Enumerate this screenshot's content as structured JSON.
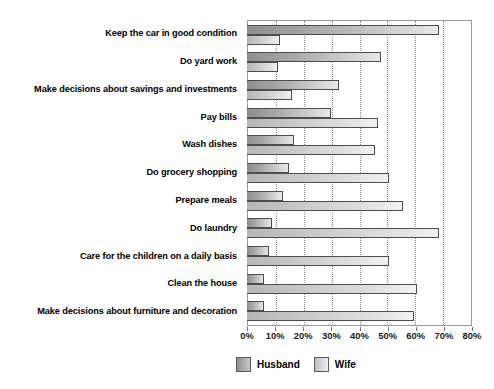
{
  "chart_data": {
    "type": "bar",
    "orientation": "horizontal",
    "title": "",
    "xlabel": "",
    "ylabel": "",
    "xlim": [
      0,
      80
    ],
    "xtick_labels": [
      "0%",
      "10%",
      "20%",
      "30%",
      "40%",
      "50%",
      "60%",
      "70%",
      "80%"
    ],
    "xtick_values": [
      0,
      10,
      20,
      30,
      40,
      50,
      60,
      70,
      80
    ],
    "grid": "vertical-dotted",
    "legend_position": "bottom",
    "categories": [
      "Keep the car in good condition",
      "Do yard work",
      "Make decisions about savings and investments",
      "Pay bills",
      "Wash dishes",
      "Do grocery shopping",
      "Prepare meals",
      "Do laundry",
      "Care for the children on a daily basis",
      "Clean the house",
      "Make decisions about furniture and decoration"
    ],
    "series": [
      {
        "name": "Husband",
        "color": "#a8a8a8",
        "values": [
          69,
          48,
          33,
          30,
          17,
          15,
          13,
          9,
          8,
          6,
          6
        ]
      },
      {
        "name": "Wife",
        "color": "#dcdcdc",
        "values": [
          12,
          11,
          16,
          47,
          46,
          51,
          56,
          69,
          51,
          61,
          60
        ]
      }
    ]
  },
  "legend": {
    "items": [
      {
        "label": "Husband",
        "swatch": "husband"
      },
      {
        "label": "Wife",
        "swatch": "wife"
      }
    ]
  }
}
